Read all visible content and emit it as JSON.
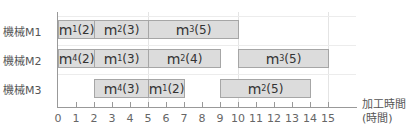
{
  "chart_data": {
    "type": "gantt",
    "title": "",
    "xlabel": "加工時間",
    "xlabel_unit": "(時間)",
    "ylabel": "",
    "xlim": [
      0,
      15
    ],
    "x_ticks": [
      "0",
      "1",
      "2",
      "3",
      "4",
      "5",
      "6",
      "7",
      "8",
      "9",
      "10",
      "11",
      "12",
      "13",
      "14",
      "15"
    ],
    "grid": "vertical at 5, 10, 15",
    "rows": [
      {
        "label": "機械M1",
        "tasks": [
          {
            "job": "m",
            "sub": "1",
            "dur": "(2)",
            "start": 0,
            "end": 2
          },
          {
            "job": "m",
            "sub": "2",
            "dur": "(3)",
            "start": 2,
            "end": 5
          },
          {
            "job": "m",
            "sub": "3",
            "dur": "(5)",
            "start": 5,
            "end": 10
          }
        ]
      },
      {
        "label": "機械M2",
        "tasks": [
          {
            "job": "m",
            "sub": "4",
            "dur": "(2)",
            "start": 0,
            "end": 2
          },
          {
            "job": "m",
            "sub": "1",
            "dur": "(3)",
            "start": 2,
            "end": 5
          },
          {
            "job": "m",
            "sub": "2",
            "dur": "(4)",
            "start": 5,
            "end": 9
          },
          {
            "job": "m",
            "sub": "3",
            "dur": "(5)",
            "start": 10,
            "end": 15
          }
        ]
      },
      {
        "label": "機械M3",
        "tasks": [
          {
            "job": "m",
            "sub": "4",
            "dur": "(3)",
            "start": 2,
            "end": 5
          },
          {
            "job": "m",
            "sub": "1",
            "dur": "(2)",
            "start": 5,
            "end": 7
          },
          {
            "job": "m",
            "sub": "2",
            "dur": "(5)",
            "start": 9,
            "end": 14
          }
        ]
      }
    ]
  }
}
